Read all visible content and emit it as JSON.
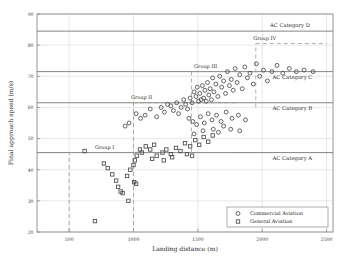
{
  "chart_data": {
    "type": "scatter",
    "title": "",
    "xlabel": "Landing distance (m)",
    "ylabel": "Final approach speed (m/s)",
    "xlim": [
      250,
      2550
    ],
    "ylim": [
      20,
      90
    ],
    "xticks": [
      500,
      1000,
      1500,
      2000,
      2500
    ],
    "yticks": [
      20,
      30,
      40,
      50,
      60,
      70,
      80,
      90
    ],
    "grid": true,
    "legend_position": "lower right",
    "series": [
      {
        "name": "Commercial Aviation",
        "marker": "circle",
        "points": [
          [
            1130,
            59.5
          ],
          [
            1180,
            57.0
          ],
          [
            1215,
            60.0
          ],
          [
            1240,
            58.5
          ],
          [
            1265,
            61.0
          ],
          [
            1290,
            60.5
          ],
          [
            1310,
            59.0
          ],
          [
            1335,
            61.5
          ],
          [
            1350,
            58.0
          ],
          [
            1370,
            60.0
          ],
          [
            1390,
            62.5
          ],
          [
            1405,
            61.0
          ],
          [
            1420,
            59.5
          ],
          [
            1440,
            63.0
          ],
          [
            1455,
            61.5
          ],
          [
            1470,
            65.0
          ],
          [
            1485,
            63.5
          ],
          [
            1495,
            66.5
          ],
          [
            1505,
            62.0
          ],
          [
            1515,
            64.5
          ],
          [
            1525,
            62.5
          ],
          [
            1535,
            67.0
          ],
          [
            1545,
            63.0
          ],
          [
            1555,
            65.5
          ],
          [
            1565,
            62.0
          ],
          [
            1575,
            68.0
          ],
          [
            1585,
            64.0
          ],
          [
            1595,
            66.0
          ],
          [
            1605,
            62.5
          ],
          [
            1615,
            69.5
          ],
          [
            1625,
            65.0
          ],
          [
            1640,
            67.5
          ],
          [
            1655,
            63.5
          ],
          [
            1670,
            70.0
          ],
          [
            1685,
            66.5
          ],
          [
            1700,
            68.5
          ],
          [
            1715,
            64.5
          ],
          [
            1730,
            71.5
          ],
          [
            1745,
            67.0
          ],
          [
            1760,
            69.0
          ],
          [
            1775,
            65.5
          ],
          [
            1790,
            72.5
          ],
          [
            1805,
            68.0
          ],
          [
            1825,
            70.5
          ],
          [
            1845,
            66.0
          ],
          [
            1865,
            73.0
          ],
          [
            1885,
            69.5
          ],
          [
            1905,
            71.0
          ],
          [
            1930,
            67.5
          ],
          [
            1955,
            74.0
          ],
          [
            1980,
            70.0
          ],
          [
            2010,
            72.0
          ],
          [
            2040,
            68.5
          ],
          [
            2075,
            71.5
          ],
          [
            2115,
            73.5
          ],
          [
            2160,
            71.0
          ],
          [
            2210,
            72.5
          ],
          [
            2265,
            71.5
          ],
          [
            2325,
            72.0
          ],
          [
            2395,
            71.5
          ],
          [
            1020,
            58.0
          ],
          [
            1055,
            56.5
          ],
          [
            1090,
            57.5
          ],
          [
            965,
            55.0
          ],
          [
            935,
            54.0
          ],
          [
            1430,
            56.5
          ],
          [
            1460,
            55.5
          ],
          [
            1490,
            54.5
          ],
          [
            1520,
            57.0
          ],
          [
            1550,
            55.0
          ],
          [
            1580,
            58.0
          ],
          [
            1610,
            56.0
          ],
          [
            1645,
            57.5
          ],
          [
            1680,
            55.5
          ],
          [
            1720,
            58.5
          ],
          [
            1765,
            56.5
          ],
          [
            1815,
            57.5
          ],
          [
            1870,
            56.0
          ],
          [
            1620,
            53.0
          ],
          [
            1660,
            52.0
          ],
          [
            1540,
            52.5
          ],
          [
            1470,
            51.5
          ],
          [
            1700,
            54.0
          ],
          [
            1755,
            53.0
          ],
          [
            1825,
            52.5
          ]
        ]
      },
      {
        "name": "General Aviation",
        "marker": "square",
        "points": [
          [
            620,
            46.0
          ],
          [
            770,
            42.0
          ],
          [
            800,
            40.5
          ],
          [
            835,
            38.5
          ],
          [
            865,
            36.5
          ],
          [
            880,
            34.5
          ],
          [
            900,
            33.0
          ],
          [
            915,
            32.5
          ],
          [
            950,
            38.0
          ],
          [
            975,
            40.0
          ],
          [
            1000,
            41.5
          ],
          [
            1010,
            43.0
          ],
          [
            1025,
            44.5
          ],
          [
            1050,
            46.5
          ],
          [
            1065,
            45.5
          ],
          [
            1095,
            47.5
          ],
          [
            1130,
            46.5
          ],
          [
            1160,
            48.0
          ],
          [
            1005,
            36.0
          ],
          [
            1020,
            35.5
          ],
          [
            960,
            30.0
          ],
          [
            700,
            23.5
          ],
          [
            1225,
            45.5
          ],
          [
            1255,
            46.5
          ],
          [
            1290,
            45.0
          ],
          [
            1330,
            47.0
          ],
          [
            1365,
            46.0
          ],
          [
            1400,
            48.5
          ],
          [
            1440,
            47.5
          ],
          [
            1480,
            49.5
          ],
          [
            1510,
            48.0
          ],
          [
            1545,
            50.5
          ],
          [
            1580,
            49.0
          ],
          [
            1615,
            51.0
          ],
          [
            1300,
            44.0
          ],
          [
            1235,
            43.0
          ],
          [
            1180,
            44.5
          ],
          [
            1145,
            43.5
          ],
          [
            1415,
            45.0
          ],
          [
            1455,
            44.5
          ]
        ]
      }
    ],
    "category_lines": [
      {
        "label": "AC Category D",
        "y": 84.5,
        "label_x": 2060,
        "label_y_offset": -4
      },
      {
        "label": "AC Category C",
        "y": 71.5,
        "label_x": 2080,
        "label_y_offset": 7
      },
      {
        "label": "AC Category B",
        "y": 61.5,
        "label_x": 2080,
        "label_y_offset": 7
      },
      {
        "label": "AC Category A",
        "y": 45.5,
        "label_x": 2080,
        "label_y_offset": 7
      }
    ],
    "group_annotations": [
      {
        "label": "Group I",
        "x": 700,
        "y": 46.8,
        "vline_x": 500,
        "vline_y0": 20,
        "vline_y1": 45.5,
        "hline_x1": 1800,
        "hline_y": 45.5
      },
      {
        "label": "Group II",
        "x": 980,
        "y": 62.8,
        "vline_x": 1000,
        "vline_y0": 20,
        "vline_y1": 61.5,
        "hline_x1": 1800,
        "hline_y": 61.5
      },
      {
        "label": "Group III",
        "x": 1470,
        "y": 72.8,
        "vline_x": 1450,
        "vline_y0": 45.5,
        "vline_y1": 71.5,
        "hline_x1": 2100,
        "hline_y": 71.5
      },
      {
        "label": "Group IV",
        "x": 1930,
        "y": 81.5,
        "vline_x": 1950,
        "vline_y0": 60.0,
        "vline_y1": 80.5,
        "hline_x1": 2500,
        "hline_y": 80.5
      }
    ],
    "legend_entries": [
      {
        "label": "Commercial Aviation",
        "marker": "circle"
      },
      {
        "label": "General Aviation",
        "marker": "square"
      }
    ]
  }
}
